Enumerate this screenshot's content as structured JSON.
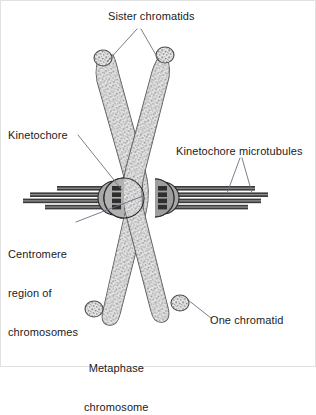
{
  "figure": {
    "background_color": "#ffffff",
    "border_color": "#e2e2e2",
    "width": 316,
    "height": 367
  },
  "labels": {
    "sister_chromatids": "Sister chromatids",
    "kinetochore": "Kinetochore",
    "kinetochore_microtubules": "Kinetochore microtubules",
    "centromere_line1": "Centromere",
    "centromere_line2": "region of",
    "centromere_line3": "chromosomes",
    "one_chromatid": "One chromatid",
    "metaphase_line1": "Metaphase",
    "metaphase_line2": "chromosome"
  },
  "colors": {
    "text": "#1b1b1b",
    "leader_line": "#6d6d80",
    "chromatid_fill": "#d8d8d8",
    "chromatid_outline": "#4a4a4a",
    "chromatid_stipple": "#8c8c8c",
    "kinetochore_fill": "#a8a8a8",
    "kinetochore_outline": "#2b2b2b",
    "microtubule_dark": "#3a3a3a",
    "microtubule_light": "#8f8f8f"
  },
  "structure": {
    "chromatid_count": 2,
    "kinetochore_count": 2,
    "microtubules_left": 4,
    "microtubules_right": 4,
    "arm_count": 4
  }
}
